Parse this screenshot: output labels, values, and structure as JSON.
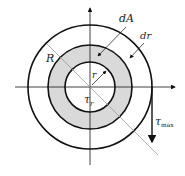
{
  "diagram": {
    "labels": {
      "dA": "dA",
      "dr": "dr",
      "R": "R",
      "r": "r",
      "tau_r": "τ",
      "tau_r_sub": "r",
      "tau_max": "τ",
      "tau_max_sub": "max"
    },
    "colors": {
      "stroke": "#111111",
      "ring_fill": "#d9d9d9",
      "diag_line": "#9a9a9a"
    }
  }
}
